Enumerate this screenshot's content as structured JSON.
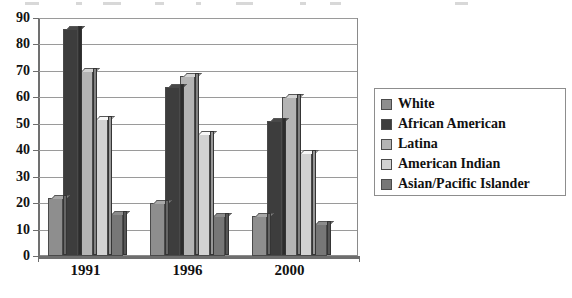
{
  "chart_data": {
    "type": "bar",
    "title": "",
    "xlabel": "",
    "ylabel": "",
    "categories": [
      "1991",
      "1996",
      "2000"
    ],
    "ylim": [
      0,
      90
    ],
    "yticks": [
      0,
      10,
      20,
      30,
      40,
      50,
      60,
      70,
      80,
      90
    ],
    "ytick_labels": [
      "0",
      "10",
      "20",
      "30",
      "40",
      "50",
      "60",
      "70",
      "80",
      "90"
    ],
    "grid": true,
    "legend_position": "right",
    "series": [
      {
        "name": "White",
        "color": "#8e8e8e",
        "values": [
          22,
          20,
          15
        ]
      },
      {
        "name": "African American",
        "color": "#3d3d3d",
        "values": [
          86,
          64,
          51
        ]
      },
      {
        "name": "Latina",
        "color": "#b4b4b4",
        "values": [
          70,
          68,
          60
        ]
      },
      {
        "name": "American Indian",
        "color": "#d2d2d2",
        "values": [
          52,
          46,
          39
        ]
      },
      {
        "name": "Asian/Pacific Islander",
        "color": "#777777",
        "values": [
          16,
          15,
          12
        ]
      }
    ]
  },
  "legend": {
    "items": [
      {
        "label": "White"
      },
      {
        "label": "African American"
      },
      {
        "label": "Latina"
      },
      {
        "label": "American Indian"
      },
      {
        "label": "Asian/Pacific Islander"
      }
    ]
  }
}
